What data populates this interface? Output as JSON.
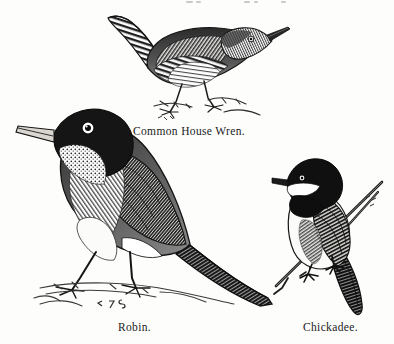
{
  "plate": {
    "background_color": "#fdfdfb",
    "ink_color": "#1a1a1a",
    "medium": "wood engraving",
    "width": 394,
    "height": 344
  },
  "figures": [
    {
      "id": "wren",
      "subject": "Common House Wren",
      "caption": "Common House Wren.",
      "facing": "right",
      "pose": "standing, tail cocked upward",
      "engraver_mark": "E 7 S"
    },
    {
      "id": "robin",
      "subject": "Robin",
      "caption": "Robin.",
      "facing": "left",
      "pose": "standing on ground, long tail to lower right",
      "engraver_mark": "E 7 S"
    },
    {
      "id": "chickadee",
      "subject": "Chickadee",
      "caption": "Chickadee.",
      "facing": "left",
      "pose": "perched on a diagonal twig",
      "engraver_mark": "E 7 S"
    }
  ],
  "captions": {
    "wren": "Common House Wren.",
    "robin": "Robin.",
    "chickadee": "Chickadee."
  }
}
